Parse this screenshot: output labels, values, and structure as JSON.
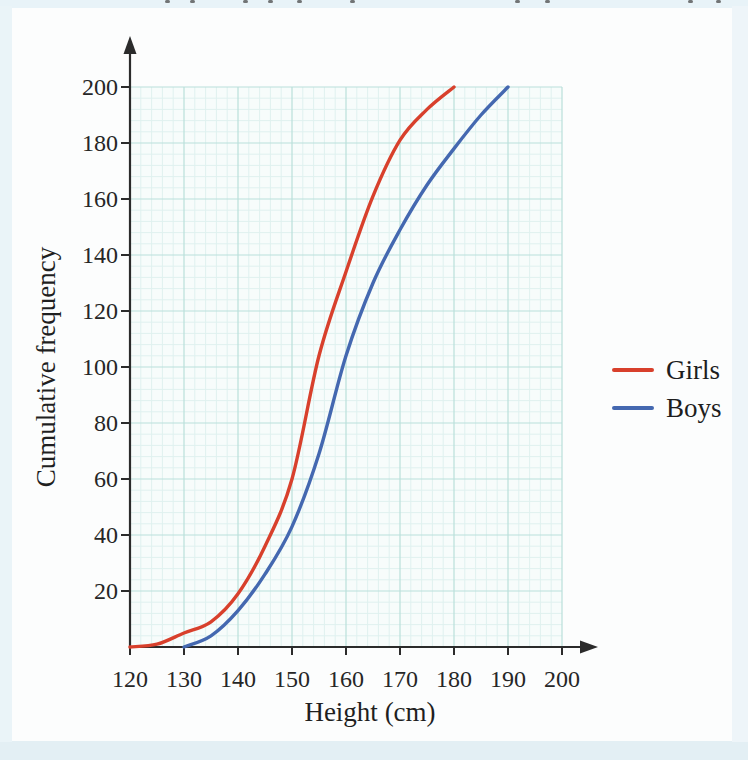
{
  "page": {
    "background": "#fcfdfd",
    "edge_top_color": "#e8f3f8",
    "edge_bottom_color": "#e3eff4",
    "edge_left_color": "#eaf4f8",
    "edge_right_color": "#eef5f9",
    "top_edge_marks_x": [
      165,
      190,
      243,
      268,
      297,
      350,
      515,
      545,
      688,
      716
    ]
  },
  "chart_data": {
    "type": "line",
    "title": "",
    "xlabel": "Height (cm)",
    "ylabel": "Cumulative frequency",
    "xlim": [
      120,
      200
    ],
    "ylim": [
      0,
      200
    ],
    "x_ticks": [
      120,
      130,
      140,
      150,
      160,
      170,
      180,
      190,
      200
    ],
    "y_ticks": [
      20,
      40,
      60,
      80,
      100,
      120,
      140,
      160,
      180,
      200
    ],
    "grid": true,
    "legend_position": "right",
    "colors": {
      "axis": "#2b2b2b",
      "grid_major": "#b9dfdb",
      "grid_minor": "#dff1ef",
      "plot_background": "#f7fcfb"
    },
    "series": [
      {
        "name": "Girls",
        "color": "#d8402c",
        "points": [
          [
            120,
            0
          ],
          [
            125,
            1
          ],
          [
            130,
            5
          ],
          [
            135,
            9
          ],
          [
            140,
            19
          ],
          [
            145,
            36
          ],
          [
            150,
            60
          ],
          [
            155,
            104
          ],
          [
            160,
            134
          ],
          [
            165,
            161
          ],
          [
            170,
            181
          ],
          [
            175,
            192
          ],
          [
            180,
            200
          ]
        ]
      },
      {
        "name": "Boys",
        "color": "#4468b0",
        "points": [
          [
            130,
            0
          ],
          [
            135,
            4
          ],
          [
            140,
            13
          ],
          [
            145,
            26
          ],
          [
            150,
            43
          ],
          [
            155,
            69
          ],
          [
            160,
            104
          ],
          [
            165,
            130
          ],
          [
            170,
            149
          ],
          [
            175,
            165
          ],
          [
            180,
            178
          ],
          [
            185,
            190
          ],
          [
            190,
            200
          ]
        ]
      }
    ]
  }
}
